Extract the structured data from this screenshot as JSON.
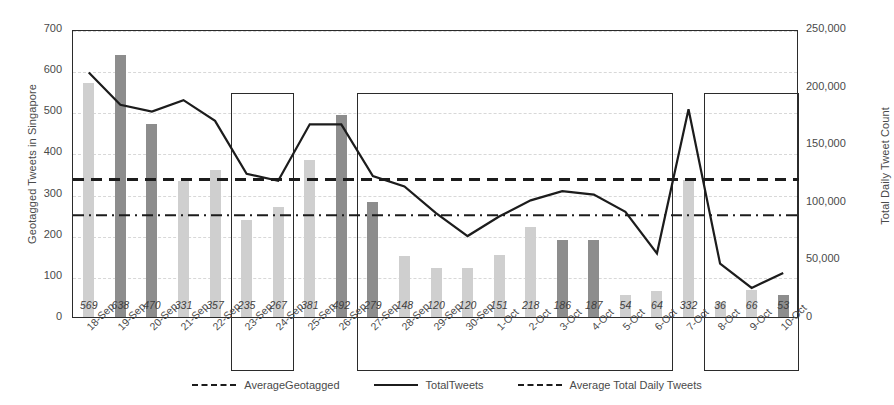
{
  "chart_data": {
    "type": "bar",
    "title": "",
    "subtitle": "",
    "xlabel": "",
    "ylabel": "Geotagged Tweets in Singapore",
    "y2label": "Total Daily Tweet Count",
    "ylim": [
      0,
      700
    ],
    "y2lim": [
      0,
      250000
    ],
    "yticks": [
      "0",
      "100",
      "200",
      "300",
      "400",
      "500",
      "600",
      "700"
    ],
    "y2ticks": [
      "0",
      "50,000",
      "100,000",
      "150,000",
      "200,000",
      "250,000"
    ],
    "grid": true,
    "legend_position": "bottom",
    "categories": [
      "18-Sep",
      "19-Sep",
      "20-Sep",
      "21-Sep",
      "22-Sep",
      "23-Sep",
      "24-Sep",
      "25-Sep",
      "26-Sep",
      "27-Sep",
      "28-Sep",
      "29-Sep",
      "30-Sep",
      "1-Oct",
      "2-Oct",
      "3-Oct",
      "4-Oct",
      "5-Oct",
      "6-Oct",
      "7-Oct",
      "8-Oct",
      "9-Oct",
      "10-Oct"
    ],
    "series": [
      {
        "name": "Geotagged Tweets in Singapore",
        "type": "bar",
        "axis": "left",
        "values": [
          569,
          638,
          470,
          331,
          357,
          235,
          267,
          381,
          492,
          279,
          148,
          120,
          120,
          151,
          218,
          186,
          187,
          54,
          64,
          332,
          36,
          66,
          53
        ],
        "shades": [
          "light",
          "dark",
          "dark",
          "light",
          "light",
          "light",
          "light",
          "light",
          "dark",
          "dark",
          "light",
          "light",
          "light",
          "light",
          "light",
          "dark",
          "dark",
          "light",
          "light",
          "light",
          "light",
          "light",
          "dark"
        ],
        "color_light": "#cfcfcf",
        "color_dark": "#8d8d8d"
      },
      {
        "name": "TotalTweets",
        "type": "line",
        "axis": "right",
        "style": "solid",
        "color": "#1c1c1c",
        "values": [
          214000,
          186000,
          180000,
          190000,
          172000,
          126000,
          120000,
          169000,
          169000,
          124000,
          115000,
          92000,
          72000,
          89000,
          103000,
          111000,
          108000,
          93000,
          57000,
          182000,
          48000,
          27000,
          40000
        ]
      },
      {
        "name": "Average Total Daily Tweets",
        "type": "reference-line",
        "axis": "right",
        "style": "dashed",
        "color": "#1c1c1c",
        "value": 121000
      },
      {
        "name": "AverageGeotagged",
        "type": "reference-line",
        "axis": "left",
        "style": "dash-dot",
        "color": "#1c1c1c",
        "value": 252
      }
    ],
    "annotations": [
      {
        "name": "highlight-box-1",
        "from": "23-Sep",
        "to": "24-Sep",
        "top_value": 550
      },
      {
        "name": "highlight-box-2",
        "from": "27-Sep",
        "to": "6-Oct",
        "top_value": 550
      },
      {
        "name": "highlight-box-3",
        "from": "8-Oct",
        "to": "10-Oct",
        "top_value": 550
      }
    ],
    "legend": [
      {
        "label": "AverageGeotagged",
        "style": "dash-dot"
      },
      {
        "label": "TotalTweets",
        "style": "solid"
      },
      {
        "label": "Average Total Daily Tweets",
        "style": "dashed"
      }
    ]
  }
}
